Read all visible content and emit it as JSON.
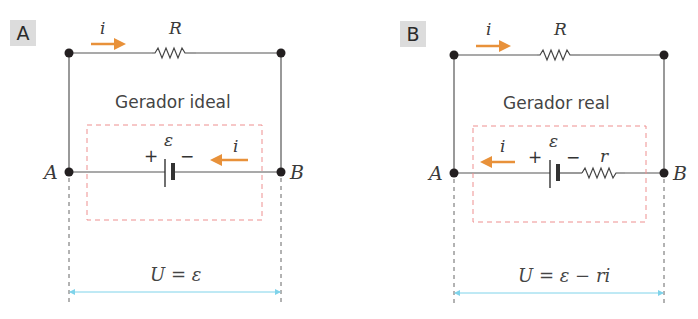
{
  "colors": {
    "wire": "#555555",
    "node": "#231f20",
    "current_arrow": "#e8913a",
    "dashed_box": "#ee8f8f",
    "measure_arrow": "#7fd3ea",
    "guide_dash": "#666666"
  },
  "panels": [
    {
      "badge": "A",
      "title": "Gerador ideal",
      "resistor_label": "R",
      "top_current_label": "i",
      "emf_label": "ε",
      "plus_label": "+",
      "minus_label": "−",
      "inner_current_label": "i",
      "inner_current_direction": "left",
      "internal_resistor_label": null,
      "node_left_label": "A",
      "node_right_label": "B",
      "equation": "U = ε"
    },
    {
      "badge": "B",
      "title": "Gerador real",
      "resistor_label": "R",
      "top_current_label": "i",
      "emf_label": "ε",
      "plus_label": "+",
      "minus_label": "−",
      "inner_current_label": "i",
      "inner_current_direction": "left",
      "internal_resistor_label": "r",
      "node_left_label": "A",
      "node_right_label": "B",
      "equation": "U = ε − ri"
    }
  ]
}
